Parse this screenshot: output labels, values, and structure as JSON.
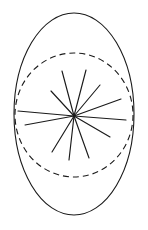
{
  "canvas": {
    "width": 148,
    "height": 230,
    "background_color": "#ffffff"
  },
  "figure": {
    "name": "radiating-star-in-ellipse",
    "stroke_color": "#1a1a1a"
  },
  "chart_data": {
    "type": "scatter",
    "title": "",
    "xlabel": "",
    "ylabel": "",
    "grid": false,
    "legend_position": "none",
    "shapes": {
      "outer_ellipse": {
        "label": "outer-ellipse",
        "center": [
          74,
          114
        ],
        "rx": 60,
        "ry": 101,
        "stroke": "#1a1a1a",
        "stroke_width": 1.1,
        "dash": "solid",
        "fill": "none"
      },
      "inner_circle": {
        "label": "inner-dashed-circle",
        "center": [
          74,
          115
        ],
        "rx": 59,
        "ry": 62,
        "stroke": "#1a1a1a",
        "stroke_width": 1.1,
        "dash": "dashed",
        "dash_pattern": "6 4",
        "fill": "none"
      }
    },
    "star_center": [
      74,
      116
    ],
    "ray_count": 11,
    "rays": [
      {
        "id": "ray-1",
        "angle_deg": 255,
        "length": 46,
        "x2": 62,
        "y2": 71
      },
      {
        "id": "ray-2",
        "angle_deg": 285,
        "length": 48,
        "x2": 86,
        "y2": 70
      },
      {
        "id": "ray-3",
        "angle_deg": 310,
        "length": 41,
        "x2": 100,
        "y2": 85
      },
      {
        "id": "ray-4",
        "angle_deg": 228,
        "length": 35,
        "x2": 51,
        "y2": 91
      },
      {
        "id": "ray-5",
        "angle_deg": 340,
        "length": 50,
        "x2": 121,
        "y2": 99
      },
      {
        "id": "ray-6",
        "angle_deg": 185,
        "length": 56,
        "x2": 18,
        "y2": 111
      },
      {
        "id": "ray-7",
        "angle_deg": 5,
        "length": 52,
        "x2": 126,
        "y2": 120
      },
      {
        "id": "ray-8",
        "angle_deg": 170,
        "length": 50,
        "x2": 25,
        "y2": 125
      },
      {
        "id": "ray-9",
        "angle_deg": 30,
        "length": 42,
        "x2": 110,
        "y2": 137
      },
      {
        "id": "ray-10",
        "angle_deg": 70,
        "length": 45,
        "x2": 89,
        "y2": 158
      },
      {
        "id": "ray-11",
        "angle_deg": 96,
        "length": 44,
        "x2": 69,
        "y2": 160
      },
      {
        "id": "ray-12",
        "angle_deg": 122,
        "length": 42,
        "x2": 52,
        "y2": 152
      }
    ]
  }
}
